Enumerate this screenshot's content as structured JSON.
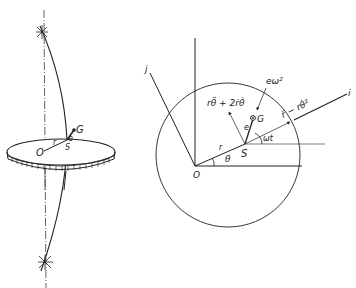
{
  "figure": {
    "left_panel": {
      "description": "Flexible shaft with disk, bearings at top and bottom",
      "labels": {
        "origin": "O",
        "radius": "r",
        "shaft_center": "S",
        "eccentricity": "e",
        "mass_center": "G"
      }
    },
    "right_panel": {
      "description": "Plan view of whirling disk with rotating axes i, j",
      "labels": {
        "axis_i": "i",
        "axis_j": "j",
        "origin": "O",
        "radius": "r",
        "angle_theta": "θ",
        "shaft_center": "S",
        "mass_center": "G",
        "eccentricity": "e",
        "spin_angle": "ωt",
        "tangential_accel": "rθ̈ + 2ṙθ̇",
        "radial_accel": "r̈ − rθ̇²",
        "centripetal": "eω²"
      }
    },
    "colors": {
      "ink": "#222222",
      "background": "#ffffff"
    }
  }
}
